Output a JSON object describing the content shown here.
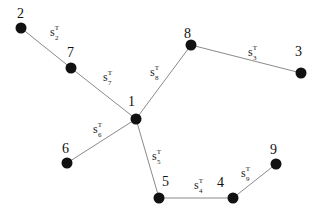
{
  "diagram": {
    "type": "tree graph",
    "nodes": [
      {
        "id": "1",
        "label": "1",
        "x": 136,
        "y": 119,
        "lx": 128,
        "ly": 106
      },
      {
        "id": "2",
        "label": "2",
        "x": 21,
        "y": 28,
        "lx": 17,
        "ly": 18
      },
      {
        "id": "3",
        "label": "3",
        "x": 301,
        "y": 73,
        "lx": 295,
        "ly": 56
      },
      {
        "id": "4",
        "label": "4",
        "x": 233,
        "y": 198,
        "lx": 217,
        "ly": 187
      },
      {
        "id": "5",
        "label": "5",
        "x": 159,
        "y": 198,
        "lx": 162,
        "ly": 186
      },
      {
        "id": "6",
        "label": "6",
        "x": 67,
        "y": 163,
        "lx": 62,
        "ly": 153
      },
      {
        "id": "7",
        "label": "7",
        "x": 71,
        "y": 68,
        "lx": 67,
        "ly": 57
      },
      {
        "id": "8",
        "label": "8",
        "x": 191,
        "y": 45,
        "lx": 184,
        "ly": 38
      },
      {
        "id": "9",
        "label": "9",
        "x": 276,
        "y": 164,
        "lx": 270,
        "ly": 154
      }
    ],
    "edges": [
      {
        "from": "2",
        "to": "7",
        "label": "s",
        "sup": "T",
        "sub": "2",
        "lx": 50,
        "ly": 36
      },
      {
        "from": "7",
        "to": "1",
        "label": "s",
        "sup": "T",
        "sub": "7",
        "lx": 103,
        "ly": 81
      },
      {
        "from": "1",
        "to": "8",
        "label": "s",
        "sup": "T",
        "sub": "8",
        "lx": 150,
        "ly": 76
      },
      {
        "from": "8",
        "to": "3",
        "label": "s",
        "sup": "T",
        "sub": "3",
        "lx": 248,
        "ly": 56
      },
      {
        "from": "1",
        "to": "6",
        "label": "s",
        "sup": "T",
        "sub": "6",
        "lx": 93,
        "ly": 133
      },
      {
        "from": "1",
        "to": "5",
        "label": "s",
        "sup": "T",
        "sub": "5",
        "lx": 152,
        "ly": 160
      },
      {
        "from": "5",
        "to": "4",
        "label": "s",
        "sup": "T",
        "sub": "4",
        "lx": 194,
        "ly": 189
      },
      {
        "from": "4",
        "to": "9",
        "label": "s",
        "sup": "T",
        "sub": "9",
        "lx": 241,
        "ly": 177
      }
    ]
  }
}
